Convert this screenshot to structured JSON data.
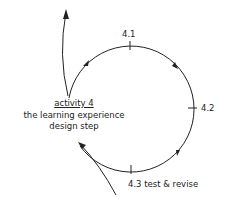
{
  "diagram": {
    "activity_title": "activity 4",
    "activity_subtitle_line1": "the learning experience",
    "activity_subtitle_line2": "design step",
    "steps": [
      {
        "id": "4.1",
        "label": "4.1"
      },
      {
        "id": "4.2",
        "label": "4.2"
      },
      {
        "id": "4.3",
        "label": "4.3  test & revise"
      }
    ],
    "stroke_color": "#222222"
  }
}
